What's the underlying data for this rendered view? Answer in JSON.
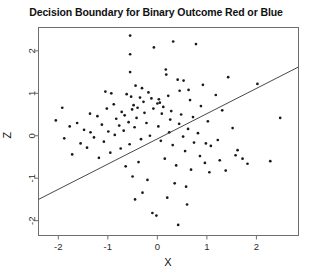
{
  "chart_data": {
    "type": "scatter",
    "title": "Decision Boundary for Binary Outcome Red or Blue",
    "xlabel": "X",
    "ylabel": "Z",
    "xlim": [
      -2.4,
      2.85
    ],
    "ylim": [
      -2.35,
      2.55
    ],
    "xticks": [
      -2,
      -1,
      0,
      1,
      2
    ],
    "yticks": [
      -2,
      -1,
      0,
      1,
      2
    ],
    "xtick_labels": [
      "-2",
      "-1",
      "0",
      "1",
      "2"
    ],
    "ytick_labels": [
      "-2",
      "-1",
      "0",
      "1",
      "2"
    ],
    "grid": false,
    "legend": "none",
    "point_color": "#1a1a1a",
    "point_size": 2.0,
    "line_color": "#333333",
    "box_color": "#6e6e6e",
    "series": [
      {
        "name": "observations",
        "marker": "point",
        "x": [
          -0.55,
          -0.07,
          0.32,
          -0.55,
          -1.05,
          -0.55,
          0.78,
          0.17,
          0.53,
          2.02,
          -1.36,
          -0.93,
          -0.53,
          -0.44,
          0.18,
          0.63,
          1.43,
          -1.77,
          -2.05,
          -1.35,
          -0.88,
          -0.62,
          -0.31,
          0.03,
          0.41,
          0.92,
          1.18,
          -1.62,
          -1.21,
          -1.02,
          -0.72,
          -0.48,
          -0.35,
          -0.18,
          0.05,
          0.22,
          0.45,
          0.66,
          0.88,
          1.31,
          -1.88,
          -1.48,
          -1.12,
          -0.83,
          -0.66,
          -0.51,
          -0.4,
          -0.28,
          -0.12,
          0.0,
          0.12,
          0.28,
          0.48,
          0.72,
          1.02,
          1.52,
          -1.55,
          -1.28,
          -0.99,
          -0.77,
          -0.58,
          -0.42,
          -0.26,
          -0.08,
          0.09,
          0.26,
          0.44,
          0.62,
          0.82,
          1.22,
          -1.72,
          -1.42,
          -1.08,
          -0.86,
          -0.68,
          -0.46,
          -0.22,
          0.02,
          0.24,
          0.52,
          0.74,
          1.08,
          1.62,
          -1.18,
          -0.95,
          -0.74,
          -0.56,
          -0.33,
          -0.15,
          0.07,
          0.31,
          0.56,
          0.86,
          1.26,
          1.82,
          -0.64,
          -0.38,
          0.15,
          0.38,
          0.68,
          1.05,
          -0.5,
          -0.2,
          0.35,
          0.58,
          -0.3,
          0.2,
          0.6,
          -0.1,
          0.42,
          2.48,
          2.28,
          1.72,
          1.38,
          0.96,
          -0.02,
          -0.45,
          0.98,
          1.58,
          -1.92
        ],
        "y": [
          2.36,
          2.08,
          2.22,
          1.92,
          1.04,
          1.5,
          2.16,
          1.56,
          1.3,
          1.22,
          0.52,
          1.0,
          0.92,
          1.18,
          1.44,
          1.08,
          1.38,
          0.22,
          0.36,
          0.08,
          0.74,
          0.98,
          1.12,
          0.86,
          1.32,
          1.2,
          0.96,
          0.3,
          0.46,
          0.64,
          0.56,
          0.72,
          0.9,
          1.02,
          0.78,
          0.94,
          1.06,
          0.84,
          0.7,
          0.6,
          -0.06,
          0.14,
          0.26,
          0.4,
          0.48,
          0.62,
          0.66,
          0.8,
          0.88,
          0.76,
          0.68,
          0.58,
          0.5,
          0.44,
          0.34,
          0.18,
          -0.18,
          -0.04,
          0.1,
          0.24,
          0.32,
          0.42,
          0.54,
          0.64,
          0.52,
          0.38,
          0.28,
          0.16,
          0.06,
          -0.1,
          -0.44,
          -0.28,
          -0.14,
          0.02,
          0.12,
          0.2,
          0.3,
          0.22,
          0.08,
          -0.02,
          -0.16,
          -0.24,
          -0.34,
          -0.52,
          -0.4,
          -0.3,
          -0.2,
          -0.08,
          0.0,
          -0.12,
          -0.22,
          -0.36,
          -0.48,
          -0.58,
          -0.66,
          -0.72,
          -0.62,
          -0.54,
          -0.7,
          -0.8,
          -0.86,
          -0.96,
          -1.04,
          -1.12,
          -1.2,
          -1.34,
          -1.46,
          -1.62,
          -1.82,
          -2.1,
          0.42,
          -0.6,
          -0.54,
          -0.82,
          -0.64,
          -1.88,
          -1.5,
          -0.18,
          -0.46,
          0.66
        ]
      }
    ],
    "boundary_line": {
      "name": "decision boundary",
      "x_start": -2.4,
      "y_start": -1.5,
      "x_end": 2.85,
      "y_end": 1.62
    }
  }
}
